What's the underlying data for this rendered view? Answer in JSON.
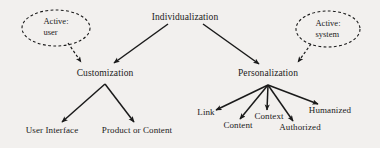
{
  "figure": {
    "kind": "hierarchy-tree-diagram",
    "background_color": "#f2f0ee",
    "ink_color": "#1a1a1a"
  },
  "nodes": {
    "root": {
      "label": "Individualization",
      "x": 185,
      "y": 18
    },
    "customization": {
      "label": "Customization",
      "x": 105,
      "y": 74
    },
    "personalization": {
      "label": "Personalization",
      "x": 268,
      "y": 74
    },
    "user_interface": {
      "label": "User Interface",
      "x": 52,
      "y": 131
    },
    "product_or_content": {
      "label": "Product or Content",
      "x": 137,
      "y": 131
    },
    "link": {
      "label": "Link",
      "x": 206,
      "y": 113
    },
    "content": {
      "label": "Content",
      "x": 238,
      "y": 126
    },
    "context": {
      "label": "Context",
      "x": 269,
      "y": 117
    },
    "authorized": {
      "label": "Authorized",
      "x": 300,
      "y": 128
    },
    "humanized": {
      "label": "Humanized",
      "x": 330,
      "y": 111
    }
  },
  "annotations": {
    "active_user": {
      "line1": "Active:",
      "line2": "user",
      "text_x": 56,
      "text_y": 27,
      "ellipse": {
        "cx": 56,
        "cy": 28,
        "rx": 34,
        "ry": 18
      }
    },
    "active_system": {
      "line1": "Active:",
      "line2": "system",
      "text_x": 328,
      "text_y": 29,
      "ellipse": {
        "cx": 328,
        "cy": 29,
        "rx": 32,
        "ry": 18
      }
    }
  },
  "edges": [
    {
      "name": "root-to-customization",
      "from": "root",
      "to": "customization",
      "style": "solid"
    },
    {
      "name": "root-to-personalization",
      "from": "root",
      "to": "personalization",
      "style": "solid"
    },
    {
      "name": "customization-to-user-interface",
      "from": "customization",
      "to": "user_interface",
      "style": "solid"
    },
    {
      "name": "customization-to-product-or-content",
      "from": "customization",
      "to": "product_or_content",
      "style": "solid"
    },
    {
      "name": "personalization-to-link",
      "from": "personalization",
      "to": "link",
      "style": "solid"
    },
    {
      "name": "personalization-to-content",
      "from": "personalization",
      "to": "content",
      "style": "solid"
    },
    {
      "name": "personalization-to-context",
      "from": "personalization",
      "to": "context",
      "style": "solid"
    },
    {
      "name": "personalization-to-authorized",
      "from": "personalization",
      "to": "authorized",
      "style": "solid"
    },
    {
      "name": "personalization-to-humanized",
      "from": "personalization",
      "to": "humanized",
      "style": "solid"
    },
    {
      "name": "active-user-to-customization",
      "from": "active_user",
      "to": "customization",
      "style": "dashed"
    },
    {
      "name": "active-system-to-personalization",
      "from": "active_system",
      "to": "personalization",
      "style": "dashed"
    }
  ]
}
